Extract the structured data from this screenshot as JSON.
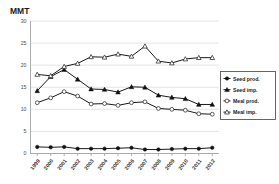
{
  "chart_data": {
    "type": "line",
    "title": "",
    "ylabel": "MMT",
    "xlabel": "",
    "ylim": [
      0,
      30
    ],
    "yticks": [
      0,
      5,
      10,
      15,
      20,
      25,
      30
    ],
    "grid": true,
    "legend_position": "right",
    "categories": [
      "1999",
      "2000",
      "2001",
      "2002",
      "2003",
      "2004",
      "2005",
      "2006",
      "2007",
      "2008",
      "2009",
      "2010",
      "2011",
      "2012"
    ],
    "series": [
      {
        "name": "Seed prod.",
        "marker": "filled-circle",
        "values": [
          1.5,
          1.4,
          1.5,
          1.1,
          1.1,
          1.1,
          1.2,
          1.3,
          0.9,
          0.9,
          1.0,
          1.1,
          1.1,
          1.3
        ]
      },
      {
        "name": "Seed imp.",
        "marker": "filled-triangle",
        "values": [
          14.2,
          17.4,
          19.0,
          16.8,
          14.6,
          14.5,
          13.9,
          15.1,
          15.0,
          13.2,
          12.7,
          12.4,
          11.1,
          11.1
        ]
      },
      {
        "name": "Meal prod.",
        "marker": "open-circle",
        "values": [
          11.5,
          12.6,
          14.0,
          13.0,
          11.2,
          11.3,
          10.9,
          11.5,
          11.7,
          10.2,
          10.0,
          9.8,
          9.0,
          8.9
        ]
      },
      {
        "name": "Meal imp.",
        "marker": "open-triangle",
        "values": [
          17.9,
          17.6,
          19.7,
          20.4,
          21.9,
          21.8,
          22.5,
          22.0,
          24.3,
          20.9,
          20.5,
          21.4,
          21.7,
          21.7
        ]
      }
    ]
  },
  "legend": {
    "entries": [
      {
        "label": "Seed prod."
      },
      {
        "label": "Seed imp."
      },
      {
        "label": "Meal prod."
      },
      {
        "label": "Meal imp."
      }
    ]
  },
  "colors": {
    "line": "#1a1a1a",
    "grid": "#d9d9d9",
    "axis": "#9a9a9a",
    "background": "#ffffff"
  }
}
